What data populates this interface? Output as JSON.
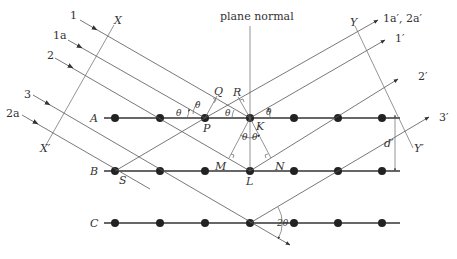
{
  "diagram": {
    "normal_label": "plane normal",
    "planes": [
      {
        "label": "A",
        "y": 118
      },
      {
        "label": "B",
        "y": 171
      },
      {
        "label": "C",
        "y": 223
      }
    ],
    "incident_rays": [
      "1",
      "1a",
      "2",
      "3",
      "2a"
    ],
    "reflected_rays": [
      "1a′, 2a′",
      "1′",
      "2′",
      "3′"
    ],
    "wavefront_labels": {
      "x_top": "X",
      "x_bottom": "X′",
      "y_top": "Y",
      "y_bottom": "Y′"
    },
    "points": [
      "P",
      "Q",
      "R",
      "K",
      "M",
      "N",
      "L",
      "S"
    ],
    "angle_label": "θ",
    "double_angle_label": "2θ",
    "spacing_label": "d′"
  }
}
